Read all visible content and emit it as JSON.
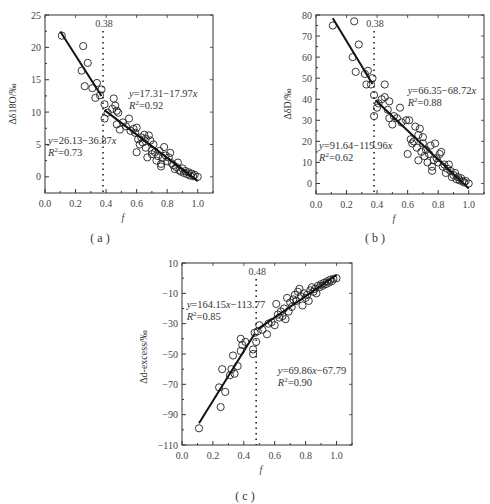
{
  "figure": {
    "captions": [
      "( a )",
      "( b )",
      "( c )"
    ]
  },
  "chart_data": [
    {
      "id": "a",
      "type": "scatter",
      "caption": "( a )",
      "xlabel": "f",
      "ylabel": "Δδ18O/‰",
      "xlim": [
        0.0,
        1.1
      ],
      "ylim": [
        -2.5,
        25
      ],
      "xticks": [
        0.0,
        0.2,
        0.4,
        0.6,
        0.8,
        1.0
      ],
      "xtick_labels": [
        "0.0",
        "0.2",
        "0.4",
        "0.6",
        "0.8",
        "1.0"
      ],
      "yticks": [
        0,
        5,
        10,
        15,
        20,
        25
      ],
      "ytick_labels": [
        "0",
        "5",
        "10",
        "15",
        "20",
        "25"
      ],
      "grid": false,
      "breakpoint": {
        "x": 0.38,
        "label": "0.38"
      },
      "fits": [
        {
          "equation": "y=26.13−36.87x",
          "r2": "R²=0.73",
          "x_range": [
            0.1,
            0.37
          ],
          "intercept": 26.13,
          "slope": -36.87,
          "label_pos": [
            0.02,
            5.0
          ]
        },
        {
          "equation": "y=17.31−17.97x",
          "r2": "R²=0.92",
          "x_range": [
            0.39,
            1.0
          ],
          "intercept": 17.31,
          "slope": -17.97,
          "label_pos": [
            0.55,
            12.3
          ]
        }
      ],
      "points": [
        [
          0.11,
          21.8
        ],
        [
          0.25,
          20.2
        ],
        [
          0.28,
          17.6
        ],
        [
          0.24,
          16.4
        ],
        [
          0.26,
          14.0
        ],
        [
          0.31,
          13.7
        ],
        [
          0.34,
          14.5
        ],
        [
          0.33,
          12.2
        ],
        [
          0.36,
          12.6
        ],
        [
          0.37,
          13.5
        ],
        [
          0.39,
          11.2
        ],
        [
          0.39,
          9.0
        ],
        [
          0.41,
          9.9
        ],
        [
          0.44,
          10.5
        ],
        [
          0.45,
          12.1
        ],
        [
          0.46,
          11.0
        ],
        [
          0.47,
          10.2
        ],
        [
          0.48,
          9.9
        ],
        [
          0.47,
          8.1
        ],
        [
          0.49,
          7.3
        ],
        [
          0.51,
          8.4
        ],
        [
          0.53,
          7.8
        ],
        [
          0.55,
          9.0
        ],
        [
          0.56,
          7.1
        ],
        [
          0.58,
          7.4
        ],
        [
          0.59,
          6.8
        ],
        [
          0.6,
          7.6
        ],
        [
          0.61,
          5.8
        ],
        [
          0.62,
          5.0
        ],
        [
          0.6,
          3.8
        ],
        [
          0.63,
          6.1
        ],
        [
          0.64,
          5.3
        ],
        [
          0.65,
          6.5
        ],
        [
          0.66,
          4.5
        ],
        [
          0.66,
          5.9
        ],
        [
          0.67,
          3.0
        ],
        [
          0.68,
          6.4
        ],
        [
          0.69,
          5.6
        ],
        [
          0.7,
          4.1
        ],
        [
          0.7,
          3.5
        ],
        [
          0.71,
          5.0
        ],
        [
          0.72,
          3.8
        ],
        [
          0.73,
          2.5
        ],
        [
          0.74,
          3.2
        ],
        [
          0.75,
          4.0
        ],
        [
          0.76,
          2.0
        ],
        [
          0.76,
          1.6
        ],
        [
          0.77,
          2.9
        ],
        [
          0.78,
          4.6
        ],
        [
          0.79,
          3.3
        ],
        [
          0.8,
          2.4
        ],
        [
          0.81,
          3.0
        ],
        [
          0.82,
          3.7
        ],
        [
          0.83,
          2.1
        ],
        [
          0.84,
          1.8
        ],
        [
          0.85,
          1.2
        ],
        [
          0.86,
          1.5
        ],
        [
          0.87,
          2.2
        ],
        [
          0.88,
          1.0
        ],
        [
          0.89,
          0.8
        ],
        [
          0.9,
          1.3
        ],
        [
          0.91,
          0.6
        ],
        [
          0.92,
          0.9
        ],
        [
          0.93,
          0.4
        ],
        [
          0.94,
          0.7
        ],
        [
          0.95,
          0.2
        ],
        [
          0.96,
          0.5
        ],
        [
          0.97,
          0.1
        ],
        [
          0.98,
          0.3
        ],
        [
          1.0,
          0.0
        ]
      ]
    },
    {
      "id": "b",
      "type": "scatter",
      "caption": "( b )",
      "xlabel": "f",
      "ylabel": "ΔδD/‰",
      "xlim": [
        0.0,
        1.1
      ],
      "ylim": [
        -5,
        80
      ],
      "xticks": [
        0.0,
        0.2,
        0.4,
        0.6,
        0.8,
        1.0
      ],
      "xtick_labels": [
        "0.0",
        "0.2",
        "0.4",
        "0.6",
        "0.8",
        "1.0"
      ],
      "yticks": [
        0,
        10,
        20,
        30,
        40,
        50,
        60,
        70,
        80
      ],
      "ytick_labels": [
        "0",
        "10",
        "20",
        "30",
        "40",
        "50",
        "60",
        "70",
        "80"
      ],
      "grid": false,
      "breakpoint": {
        "x": 0.38,
        "label": "0.38"
      },
      "fits": [
        {
          "equation": "y=91.64−119.96x",
          "r2": "R²=0.62",
          "x_range": [
            0.11,
            0.37
          ],
          "intercept": 91.64,
          "slope": -119.96,
          "label_pos": [
            0.02,
            16.5
          ]
        },
        {
          "equation": "y=66.35−68.72x",
          "r2": "R²=0.88",
          "x_range": [
            0.39,
            1.0
          ],
          "intercept": 66.35,
          "slope": -68.72,
          "label_pos": [
            0.6,
            42.5
          ]
        }
      ],
      "points": [
        [
          0.11,
          75
        ],
        [
          0.25,
          77
        ],
        [
          0.28,
          66
        ],
        [
          0.24,
          60
        ],
        [
          0.26,
          53
        ],
        [
          0.32,
          52
        ],
        [
          0.34,
          53.5
        ],
        [
          0.33,
          47
        ],
        [
          0.36,
          47
        ],
        [
          0.37,
          50
        ],
        [
          0.38,
          42
        ],
        [
          0.38,
          32
        ],
        [
          0.4,
          36
        ],
        [
          0.41,
          38
        ],
        [
          0.43,
          40
        ],
        [
          0.45,
          47
        ],
        [
          0.45,
          41
        ],
        [
          0.47,
          35
        ],
        [
          0.48,
          39
        ],
        [
          0.48,
          31
        ],
        [
          0.5,
          28
        ],
        [
          0.51,
          32
        ],
        [
          0.53,
          31
        ],
        [
          0.55,
          36
        ],
        [
          0.56,
          29
        ],
        [
          0.59,
          30
        ],
        [
          0.61,
          30
        ],
        [
          0.6,
          14
        ],
        [
          0.62,
          21
        ],
        [
          0.63,
          19
        ],
        [
          0.64,
          20
        ],
        [
          0.65,
          27
        ],
        [
          0.66,
          17
        ],
        [
          0.67,
          23
        ],
        [
          0.67,
          11
        ],
        [
          0.68,
          26
        ],
        [
          0.69,
          15
        ],
        [
          0.7,
          22
        ],
        [
          0.7,
          19
        ],
        [
          0.71,
          13
        ],
        [
          0.72,
          16
        ],
        [
          0.73,
          10
        ],
        [
          0.74,
          14
        ],
        [
          0.75,
          18
        ],
        [
          0.76,
          6
        ],
        [
          0.76,
          8
        ],
        [
          0.77,
          11
        ],
        [
          0.78,
          19
        ],
        [
          0.79,
          12
        ],
        [
          0.8,
          10
        ],
        [
          0.81,
          14
        ],
        [
          0.82,
          15
        ],
        [
          0.83,
          8
        ],
        [
          0.84,
          9
        ],
        [
          0.85,
          5
        ],
        [
          0.86,
          7
        ],
        [
          0.87,
          9
        ],
        [
          0.88,
          6
        ],
        [
          0.89,
          3
        ],
        [
          0.9,
          4
        ],
        [
          0.91,
          5
        ],
        [
          0.92,
          2
        ],
        [
          0.93,
          3
        ],
        [
          0.94,
          1.5
        ],
        [
          0.95,
          2.5
        ],
        [
          0.96,
          1
        ],
        [
          0.97,
          0.5
        ],
        [
          0.98,
          1.2
        ],
        [
          1.0,
          0
        ]
      ]
    },
    {
      "id": "c",
      "type": "scatter",
      "caption": "( c )",
      "xlabel": "f",
      "ylabel": "Δd-excess/‰",
      "xlim": [
        0.0,
        1.1
      ],
      "ylim": [
        -110,
        10
      ],
      "xticks": [
        0.0,
        0.2,
        0.4,
        0.6,
        0.8,
        1.0
      ],
      "xtick_labels": [
        "0.0",
        "0.2",
        "0.4",
        "0.6",
        "0.8",
        "1.0"
      ],
      "yticks": [
        -110,
        -90,
        -70,
        -50,
        -30,
        -10,
        10
      ],
      "ytick_labels": [
        "−110",
        "−90",
        "−70",
        "−50",
        "−30",
        "−10",
        "10"
      ],
      "grid": false,
      "breakpoint": {
        "x": 0.48,
        "label": "0.48"
      },
      "fits": [
        {
          "equation": "y=164.15x−113.77",
          "r2": "R²=0.85",
          "x_range": [
            0.11,
            0.47
          ],
          "intercept": -113.77,
          "slope": 164.15,
          "label_pos": [
            0.03,
            -19.5
          ]
        },
        {
          "equation": "y=69.86x−67.79",
          "r2": "R²=0.90",
          "x_range": [
            0.49,
            1.0
          ],
          "intercept": -67.79,
          "slope": 69.86,
          "label_pos": [
            0.62,
            -63
          ]
        }
      ],
      "points": [
        [
          0.11,
          -99
        ],
        [
          0.24,
          -72
        ],
        [
          0.25,
          -85
        ],
        [
          0.26,
          -60
        ],
        [
          0.28,
          -75
        ],
        [
          0.31,
          -64
        ],
        [
          0.32,
          -60
        ],
        [
          0.33,
          -51
        ],
        [
          0.34,
          -63
        ],
        [
          0.36,
          -58
        ],
        [
          0.38,
          -48
        ],
        [
          0.38,
          -40
        ],
        [
          0.39,
          -44
        ],
        [
          0.41,
          -42
        ],
        [
          0.46,
          -47
        ],
        [
          0.46,
          -50
        ],
        [
          0.47,
          -36
        ],
        [
          0.48,
          -42
        ],
        [
          0.49,
          -35
        ],
        [
          0.5,
          -31
        ],
        [
          0.52,
          -34
        ],
        [
          0.55,
          -37
        ],
        [
          0.56,
          -30
        ],
        [
          0.58,
          -29
        ],
        [
          0.6,
          -31
        ],
        [
          0.61,
          -17
        ],
        [
          0.62,
          -24
        ],
        [
          0.63,
          -26
        ],
        [
          0.64,
          -22
        ],
        [
          0.65,
          -25
        ],
        [
          0.66,
          -20
        ],
        [
          0.67,
          -27
        ],
        [
          0.68,
          -13
        ],
        [
          0.69,
          -22
        ],
        [
          0.7,
          -16
        ],
        [
          0.71,
          -19
        ],
        [
          0.72,
          -14
        ],
        [
          0.73,
          -11
        ],
        [
          0.74,
          -15
        ],
        [
          0.75,
          -9
        ],
        [
          0.76,
          -7
        ],
        [
          0.77,
          -12
        ],
        [
          0.78,
          -18
        ],
        [
          0.79,
          -10
        ],
        [
          0.8,
          -13
        ],
        [
          0.81,
          -11
        ],
        [
          0.82,
          -15
        ],
        [
          0.83,
          -8
        ],
        [
          0.84,
          -6
        ],
        [
          0.85,
          -9
        ],
        [
          0.86,
          -7
        ],
        [
          0.87,
          -10
        ],
        [
          0.88,
          -5
        ],
        [
          0.89,
          -6
        ],
        [
          0.9,
          -4
        ],
        [
          0.91,
          -5
        ],
        [
          0.92,
          -3
        ],
        [
          0.93,
          -4
        ],
        [
          0.94,
          -2
        ],
        [
          0.95,
          -3
        ],
        [
          0.96,
          -1
        ],
        [
          0.97,
          -2
        ],
        [
          0.98,
          -0.5
        ],
        [
          1.0,
          0
        ]
      ]
    }
  ]
}
